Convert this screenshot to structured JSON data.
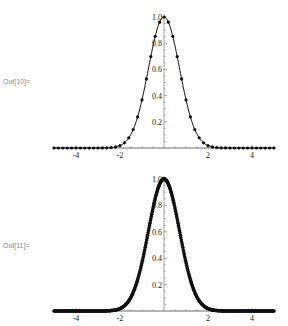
{
  "cells": [
    {
      "label": "Out[10]="
    },
    {
      "label": "Out[11]="
    }
  ],
  "chart_data": [
    {
      "type": "line",
      "title": "",
      "xlabel": "",
      "ylabel": "",
      "function": "Exp[-x^2]",
      "xlim": [
        -5,
        5
      ],
      "ylim": [
        0,
        1.0
      ],
      "xticks": [
        -4,
        -2,
        2,
        4
      ],
      "xtick_labels": [
        "-4",
        "-2",
        "2",
        "4"
      ],
      "yticks": [
        0.2,
        0.4,
        0.6,
        0.8,
        1.0
      ],
      "ytick_labels": [
        "0.2",
        "0.4",
        "0.6",
        "0.8",
        "1.0"
      ],
      "grid": false,
      "legend": "none",
      "markers": "uniform",
      "marker_x": [
        -5,
        -4.8,
        -4.6,
        -4.4,
        -4.2,
        -4,
        -3.8,
        -3.6,
        -3.4,
        -3.2,
        -3,
        -2.8,
        -2.6,
        -2.4,
        -2.2,
        -2,
        -1.8,
        -1.6,
        -1.4,
        -1.2,
        -1,
        -0.8,
        -0.6,
        -0.4,
        -0.2,
        0,
        0.2,
        0.4,
        0.6,
        0.8,
        1,
        1.2,
        1.4,
        1.6,
        1.8,
        2,
        2.2,
        2.4,
        2.6,
        2.8,
        3,
        3.2,
        3.4,
        3.6,
        3.8,
        4,
        4.2,
        4.4,
        4.6,
        4.8,
        5
      ]
    },
    {
      "type": "line",
      "title": "",
      "xlabel": "",
      "ylabel": "",
      "function": "Exp[-x^2]",
      "xlim": [
        -5,
        5
      ],
      "ylim": [
        0,
        1.0
      ],
      "xticks": [
        -4,
        -2,
        2,
        4
      ],
      "xtick_labels": [
        "-4",
        "-2",
        "2",
        "4"
      ],
      "yticks": [
        0.2,
        0.4,
        0.6,
        0.8,
        1.0
      ],
      "ytick_labels": [
        "0.2",
        "0.4",
        "0.6",
        "0.8",
        "1.0"
      ],
      "grid": false,
      "legend": "none",
      "markers": "adaptive-dense",
      "marker_count": 400
    }
  ]
}
